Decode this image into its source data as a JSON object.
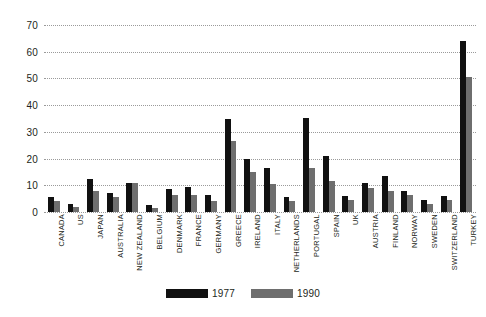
{
  "chart_data": {
    "type": "bar",
    "title": "",
    "subtitle": "",
    "xlabel": "",
    "ylabel": "",
    "ylim": [
      0,
      70
    ],
    "yticks": [
      0,
      10,
      20,
      30,
      40,
      50,
      60,
      70
    ],
    "grid": "horizontal-dotted",
    "legend_position": "bottom-center",
    "categories": [
      "CANADA",
      "US",
      "JAPAN",
      "AUSTRALIA",
      "NEW ZEALAND",
      "BELGIUM",
      "DENMARK",
      "FRANCE",
      "GERMANY",
      "GREECE",
      "IRELAND",
      "ITALY",
      "NETHERLANDS",
      "PORTUGAL",
      "SPAIN",
      "UK",
      "AUSTRIA",
      "FINLAND",
      "NORWAY",
      "SWEDEN",
      "SWITZERLAND",
      "TURKEY"
    ],
    "series": [
      {
        "name": "1977",
        "color": "#111111",
        "values": [
          5.5,
          3,
          12.5,
          7,
          11,
          2.8,
          8.5,
          9.5,
          6.5,
          35,
          20,
          16.5,
          5.8,
          35.3,
          21,
          6,
          11,
          13.3,
          8,
          4.5,
          6,
          64
        ]
      },
      {
        "name": "1990",
        "color": "#6e6e6e",
        "values": [
          4,
          2,
          8,
          5.5,
          11,
          1.6,
          6.3,
          6.5,
          4.3,
          26.5,
          15,
          10.5,
          4.3,
          16.3,
          11.5,
          4.5,
          9,
          7.8,
          6.5,
          3,
          4.5,
          50.5
        ]
      }
    ]
  },
  "legend": {
    "entries": [
      {
        "label": "1977",
        "color": "#111111"
      },
      {
        "label": "1990",
        "color": "#6e6e6e"
      }
    ]
  }
}
